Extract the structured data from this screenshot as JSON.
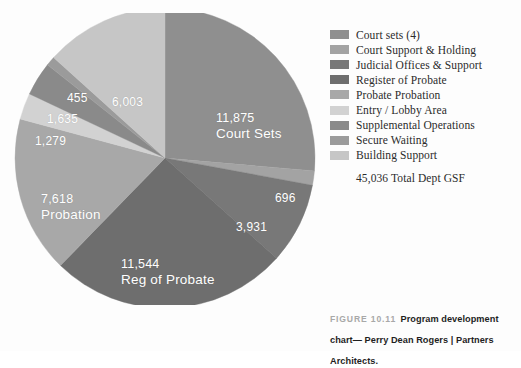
{
  "figure": {
    "number_label": "FIGURE 10.11",
    "caption_text": "Program development chart— Perry Dean Rogers | Partners Architects."
  },
  "legend": {
    "total_label": "45,036 Total Dept GSF",
    "items": [
      {
        "label": "Court sets  (4)",
        "color": "#8f8f8f"
      },
      {
        "label": "Court Support & Holding",
        "color": "#a3a3a3"
      },
      {
        "label": "Judicial Offices & Support",
        "color": "#787878"
      },
      {
        "label": "Register of Probate",
        "color": "#6e6e6e"
      },
      {
        "label": "Probate Probation",
        "color": "#a8a8a8"
      },
      {
        "label": "Entry / Lobby Area",
        "color": "#d2d2d2"
      },
      {
        "label": "Supplemental Operations",
        "color": "#8a8a8a"
      },
      {
        "label": "Secure Waiting",
        "color": "#9b9b9b"
      },
      {
        "label": "Building Support",
        "color": "#c6c6c6"
      }
    ]
  },
  "pie_labels": {
    "court_sets": {
      "value": "11,875",
      "name": "Court Sets"
    },
    "court_support": {
      "value": "696",
      "name": ""
    },
    "judicial": {
      "value": "3,931",
      "name": ""
    },
    "reg_probate": {
      "value": "11,544",
      "name": "Reg of Probate"
    },
    "probation": {
      "value": "7,618",
      "name": "Probation"
    },
    "entry_lobby": {
      "value": "1,279",
      "name": ""
    },
    "supplemental": {
      "value": "1,635",
      "name": ""
    },
    "secure_waiting": {
      "value": "455",
      "name": ""
    },
    "building_support": {
      "value": "6,003",
      "name": ""
    }
  },
  "chart_data": {
    "type": "pie",
    "title": "Program development chart",
    "xlabel": "",
    "ylabel": "",
    "grid": false,
    "legend_position": "right",
    "total": 45036,
    "total_label": "45,036 Total Dept GSF",
    "units": "GSF",
    "start_angle_deg": 0,
    "direction": "clockwise",
    "labels": [
      "Court sets  (4)",
      "Court Support & Holding",
      "Judicial Offices & Support",
      "Register of Probate",
      "Probate Probation",
      "Entry / Lobby Area",
      "Supplemental Operations",
      "Secure Waiting",
      "Building Support"
    ],
    "values": [
      11875,
      696,
      3931,
      11544,
      7618,
      1279,
      1635,
      455,
      6003
    ],
    "colors": [
      "#8f8f8f",
      "#a3a3a3",
      "#787878",
      "#6e6e6e",
      "#a8a8a8",
      "#d2d2d2",
      "#8a8a8a",
      "#9b9b9b",
      "#c6c6c6"
    ],
    "slices": [
      {
        "label": "Court sets  (4)",
        "short_label": "Court Sets",
        "value": 11875,
        "percent": 26.4,
        "color": "#8f8f8f",
        "data_label": "11,875"
      },
      {
        "label": "Court Support & Holding",
        "short_label": "",
        "value": 696,
        "percent": 1.5,
        "color": "#a3a3a3",
        "data_label": "696"
      },
      {
        "label": "Judicial Offices & Support",
        "short_label": "",
        "value": 3931,
        "percent": 8.7,
        "color": "#787878",
        "data_label": "3,931"
      },
      {
        "label": "Register of Probate",
        "short_label": "Reg of Probate",
        "value": 11544,
        "percent": 25.6,
        "color": "#6e6e6e",
        "data_label": "11,544"
      },
      {
        "label": "Probate Probation",
        "short_label": "Probation",
        "value": 7618,
        "percent": 16.9,
        "color": "#a8a8a8",
        "data_label": "7,618"
      },
      {
        "label": "Entry / Lobby Area",
        "short_label": "",
        "value": 1279,
        "percent": 2.8,
        "color": "#d2d2d2",
        "data_label": "1,279"
      },
      {
        "label": "Supplemental Operations",
        "short_label": "",
        "value": 1635,
        "percent": 3.6,
        "color": "#8a8a8a",
        "data_label": "1,635"
      },
      {
        "label": "Secure Waiting",
        "short_label": "",
        "value": 455,
        "percent": 1.0,
        "color": "#9b9b9b",
        "data_label": "455"
      },
      {
        "label": "Building Support",
        "short_label": "",
        "value": 6003,
        "percent": 13.3,
        "color": "#c6c6c6",
        "data_label": "6,003"
      }
    ]
  }
}
